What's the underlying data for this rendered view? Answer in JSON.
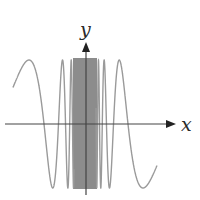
{
  "figure": {
    "x_axis_label": "x",
    "y_axis_label": "y"
  },
  "chart_data": {
    "type": "line",
    "title": "",
    "xlabel": "x",
    "ylabel": "y",
    "function": "y = sin(1/x) (odd, oscillates infinitely near x = 0)",
    "ylim": [
      -1,
      1
    ],
    "grid": false,
    "legend": "none",
    "series": [
      {
        "name": "curve",
        "color": "#9a9a9a",
        "amplitude": 1
      }
    ]
  },
  "render": {
    "origin_x": 86,
    "origin_y": 124,
    "amplitude_px": 64,
    "c": 250.7,
    "phi": 2.827,
    "x_min_px": 13,
    "x_max_px": 157,
    "axis_color": "#444444",
    "curve_color": "#9a9a9a",
    "band_color": "#8c8c8c",
    "band_left_px": 73,
    "band_right_px": 97
  }
}
